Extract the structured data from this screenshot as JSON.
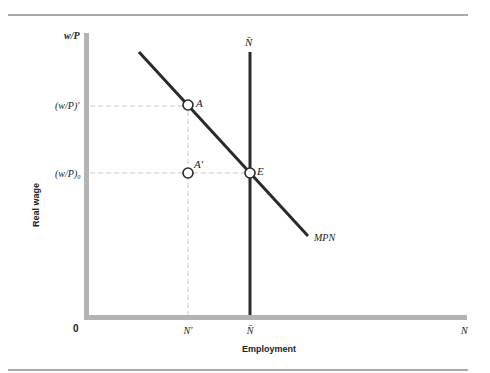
{
  "diagram": {
    "axes": {
      "y_label": "Real wage",
      "y_var": "w/P",
      "x_label": "Employment",
      "x_var": "N",
      "origin": "0"
    },
    "y_ticks": [
      {
        "label": "(w/P)′",
        "id": "w_over_p_prime"
      },
      {
        "label": "(w/P)₀",
        "id": "w_over_p_zero"
      }
    ],
    "x_ticks": [
      {
        "label": "N′",
        "id": "n_prime"
      },
      {
        "label": "N̄",
        "id": "n_bar"
      }
    ],
    "curves": {
      "labor_demand": "MPN",
      "labor_supply": "N̄"
    },
    "points": {
      "A": "A",
      "A_prime": "A′",
      "E": "E"
    },
    "colors": {
      "axis": "#b3b3b3",
      "curve": "#2a2a2a",
      "dashed_guides": "#c8c8c8",
      "rule": "#555555"
    }
  }
}
